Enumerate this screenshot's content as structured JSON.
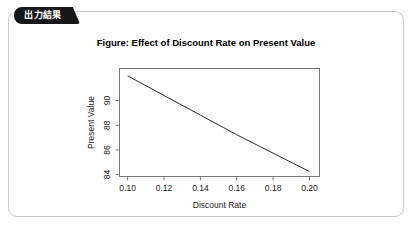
{
  "card": {
    "tab_label": "出力結果"
  },
  "chart_data": {
    "type": "line",
    "title": "Figure: Effect of Discount Rate on Present Value",
    "xlabel": "Discount Rate",
    "ylabel": "Present Value",
    "grid": false,
    "legend": false,
    "xlim": [
      0.0955,
      0.2055
    ],
    "ylim": [
      82.8,
      91.6
    ],
    "xticks": [
      0.1,
      0.12,
      0.14,
      0.16,
      0.18,
      0.2
    ],
    "xtick_labels": [
      "0.10",
      "0.12",
      "0.14",
      "0.16",
      "0.18",
      "0.20"
    ],
    "yticks": [
      84,
      86,
      88,
      90
    ],
    "ytick_labels": [
      "84",
      "86",
      "88",
      "90"
    ],
    "x": [
      0.1,
      0.12,
      0.14,
      0.16,
      0.18,
      0.2
    ],
    "values": [
      91.0,
      89.4,
      87.8,
      86.2,
      84.7,
      83.2
    ],
    "series": [
      {
        "name": "Present Value",
        "values": [
          91.0,
          89.4,
          87.8,
          86.2,
          84.7,
          83.2
        ]
      }
    ]
  },
  "colors": {
    "tab_background": "#17171a",
    "tab_text": "#ffffff",
    "card_border": "#c9c9c9",
    "plot_frame": "#7a7a7a",
    "line": "#2b2b2b",
    "page_background": "#ffffff"
  }
}
